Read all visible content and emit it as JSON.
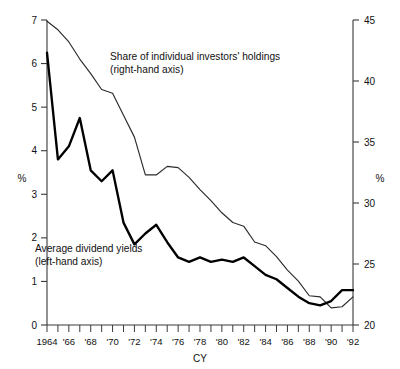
{
  "chart_data": {
    "type": "line",
    "title": "",
    "xlabel": "CY",
    "ylabel_left": "%",
    "ylabel_right": "%",
    "x": [
      1964,
      1965,
      1966,
      1967,
      1968,
      1969,
      1970,
      1971,
      1972,
      1973,
      1974,
      1975,
      1976,
      1977,
      1978,
      1979,
      1980,
      1981,
      1982,
      1983,
      1984,
      1985,
      1986,
      1987,
      1988,
      1989,
      1990,
      1991,
      1992
    ],
    "xlim": [
      1964,
      1992
    ],
    "xtick_labels": [
      "1964",
      "'66",
      "'68",
      "'70",
      "'72",
      "'74",
      "'76",
      "'78",
      "'80",
      "'82",
      "'84",
      "'86",
      "'88",
      "'90",
      "'92"
    ],
    "xtick_values": [
      1964,
      1966,
      1968,
      1970,
      1972,
      1974,
      1976,
      1978,
      1980,
      1982,
      1984,
      1986,
      1988,
      1990,
      1992
    ],
    "xtick_minor_step": 1,
    "ylim_left": [
      0,
      7
    ],
    "ytick_left": [
      0,
      1,
      2,
      3,
      4,
      5,
      6,
      7
    ],
    "ylim_right": [
      20,
      45
    ],
    "ytick_right": [
      20,
      25,
      30,
      35,
      40,
      45
    ],
    "grid": false,
    "legend": "annotations",
    "annotations": [
      {
        "name": "share-of-individual-investors-label",
        "line1": "Share of individual investors' holdings",
        "line2": "(right-hand axis)",
        "x": 110,
        "y": 60,
        "series": "share_individual_investors"
      },
      {
        "name": "average-dividend-yields-label",
        "line1": "Average dividend yields",
        "line2": "(left-hand axis)",
        "x": 35,
        "y": 252,
        "series": "average_dividend_yields"
      }
    ],
    "series": [
      {
        "name": "Average dividend yields",
        "key": "average_dividend_yields",
        "axis": "left",
        "style": "thick",
        "color": "#000000",
        "values": [
          6.25,
          3.8,
          4.1,
          4.75,
          3.55,
          3.3,
          3.55,
          2.35,
          1.85,
          2.1,
          2.3,
          1.9,
          1.55,
          1.45,
          1.55,
          1.45,
          1.5,
          1.45,
          1.55,
          1.35,
          1.15,
          1.05,
          0.85,
          0.65,
          0.5,
          0.45,
          0.55,
          0.8,
          0.8
        ]
      },
      {
        "name": "Share of individual investors' holdings",
        "key": "share_individual_investors",
        "axis": "right",
        "style": "thin",
        "color": "#2b2b2b",
        "values": [
          44.9,
          44.2,
          43.2,
          41.8,
          40.6,
          39.3,
          39.0,
          37.2,
          35.4,
          32.3,
          32.3,
          33.0,
          32.9,
          32.1,
          31.1,
          30.2,
          29.2,
          28.4,
          28.1,
          26.8,
          26.5,
          25.6,
          24.5,
          23.6,
          22.4,
          22.3,
          21.4,
          21.5,
          22.3
        ]
      }
    ]
  },
  "axes": {
    "left_unit": "%",
    "right_unit": "%",
    "x_title": "CY"
  }
}
